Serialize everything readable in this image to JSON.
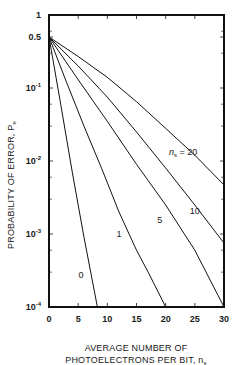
{
  "chart_data": {
    "type": "line",
    "title": "",
    "xlabel": "AVERAGE NUMBER OF PHOTOELECTRONS PER BIT, n_s",
    "xlabel_lines": [
      "AVERAGE NUMBER OF",
      "PHOTOELECTRONS PER BIT, n"
    ],
    "xlabel_subscript": "s",
    "ylabel": "PROBABILITY OF ERROR, P_e",
    "ylabel_main": "PROBABILITY OF ERROR, P",
    "ylabel_subscript": "e",
    "yscale": "log",
    "xlim": [
      0,
      30
    ],
    "ylim": [
      0.0001,
      1
    ],
    "grid": false,
    "legend": "inline curve labels",
    "x_ticks": [
      0,
      5,
      10,
      15,
      20,
      25,
      30
    ],
    "x_tick_labels": [
      "0",
      "5",
      "10",
      "15",
      "20",
      "25",
      "30"
    ],
    "y_ticks": [
      1,
      0.5,
      0.1,
      0.01,
      0.001,
      0.0001
    ],
    "y_tick_labels": [
      {
        "base": "1",
        "exp": ""
      },
      {
        "base": "0.5",
        "exp": ""
      },
      {
        "base": "10",
        "exp": "-1"
      },
      {
        "base": "10",
        "exp": "-2"
      },
      {
        "base": "10",
        "exp": "-3"
      },
      {
        "base": "10",
        "exp": "-4"
      }
    ],
    "series": [
      {
        "name": "0",
        "label": "0",
        "x": [
          0,
          2,
          4,
          6,
          8.3
        ],
        "y": [
          0.5,
          0.06,
          0.007,
          0.0009,
          0.0001
        ]
      },
      {
        "name": "1",
        "label": "1",
        "x": [
          0,
          3,
          6,
          9,
          12,
          15,
          17,
          20
        ],
        "y": [
          0.5,
          0.12,
          0.03,
          0.008,
          0.002,
          0.0006,
          0.0003,
          0.0001
        ]
      },
      {
        "name": "5",
        "label": "5",
        "x": [
          0,
          5,
          10,
          15,
          20,
          25,
          30
        ],
        "y": [
          0.5,
          0.13,
          0.035,
          0.009,
          0.0025,
          0.0006,
          0.0001
        ]
      },
      {
        "name": "10",
        "label": "10",
        "x": [
          0,
          5,
          10,
          15,
          20,
          25,
          30
        ],
        "y": [
          0.5,
          0.2,
          0.075,
          0.025,
          0.008,
          0.0025,
          0.00075
        ]
      },
      {
        "name": "20",
        "label": "n_s = 20",
        "x": [
          0,
          5,
          10,
          15,
          20,
          25,
          30
        ],
        "y": [
          0.5,
          0.27,
          0.14,
          0.065,
          0.028,
          0.012,
          0.0047
        ]
      }
    ],
    "annotations": [
      {
        "text": "n_s = 20",
        "x": 23,
        "y": 0.012
      },
      {
        "text": "10",
        "x": 25,
        "y": 0.0019
      },
      {
        "text": "5",
        "x": 19,
        "y": 0.0014
      },
      {
        "text": "1",
        "x": 12,
        "y": 0.0009
      },
      {
        "text": "0",
        "x": 5.5,
        "y": 0.00025
      }
    ]
  }
}
